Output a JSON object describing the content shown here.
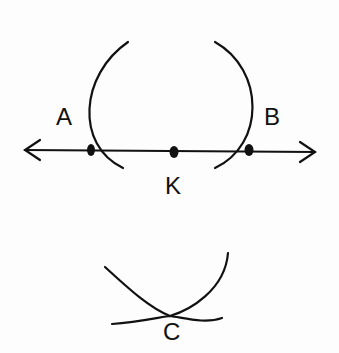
{
  "diagram": {
    "type": "geometric construction",
    "labels": {
      "a": "A",
      "b": "B",
      "k": "K",
      "c": "C"
    },
    "line": {
      "x1": 25,
      "y1": 150,
      "x2": 315,
      "y2": 152
    },
    "points": [
      {
        "name": "A",
        "x": 90,
        "y": 150
      },
      {
        "name": "K",
        "x": 175,
        "y": 152
      },
      {
        "name": "B",
        "x": 250,
        "y": 150
      }
    ]
  }
}
